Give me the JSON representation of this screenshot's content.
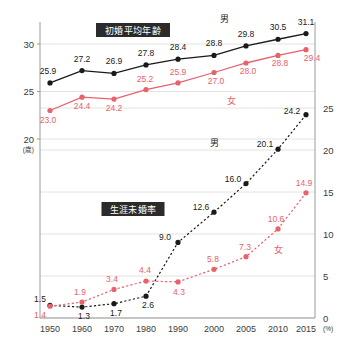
{
  "chart_data": {
    "type": "line",
    "title": "",
    "categories": [
      "1950",
      "1960",
      "1970",
      "1980",
      "1990",
      "2000",
      "2005",
      "2010",
      "2015"
    ],
    "x": [
      1950,
      1960,
      1970,
      1980,
      1990,
      2000,
      2005,
      2010,
      2015
    ],
    "panels": [
      {
        "key": "marriage_age",
        "badge": "初婚平均年齢",
        "axis": "left",
        "ylabel": "(歳)",
        "yticks": [
          20,
          25,
          30
        ],
        "ylim": [
          0,
          32.5
        ],
        "series": [
          {
            "name": "男",
            "color": "#1a1a1a",
            "style": "solid",
            "values": [
              25.9,
              27.2,
              26.9,
              27.8,
              28.4,
              28.8,
              29.8,
              30.5,
              31.1
            ]
          },
          {
            "name": "女",
            "color": "#e8616b",
            "style": "solid",
            "values": [
              23.0,
              24.4,
              24.2,
              25.2,
              25.9,
              27.0,
              28.0,
              28.8,
              29.4
            ]
          }
        ]
      },
      {
        "key": "lifetime_unmarried_rate",
        "badge": "生涯未婚率",
        "axis": "right",
        "ylabel": "(%)",
        "yticks": [
          0,
          5,
          10,
          15,
          20,
          25
        ],
        "ylim": [
          0,
          26
        ],
        "series": [
          {
            "name": "男",
            "color": "#1a1a1a",
            "style": "dashed",
            "values": [
              1.5,
              1.3,
              1.7,
              2.6,
              9.0,
              12.6,
              16.0,
              20.1,
              24.2
            ]
          },
          {
            "name": "女",
            "color": "#e8616b",
            "style": "dashed",
            "values": [
              1.4,
              1.9,
              3.4,
              4.4,
              4.3,
              5.8,
              7.3,
              10.6,
              14.9
            ]
          }
        ]
      }
    ],
    "axis_left": {
      "ticks": [
        "30",
        "25",
        "20"
      ],
      "unit": "(歳)"
    },
    "axis_right": {
      "ticks": [
        "25",
        "20",
        "15",
        "10",
        "5",
        "0"
      ],
      "unit": "(%)"
    },
    "legend": [
      {
        "label": "男",
        "color": "#1a1a1a"
      },
      {
        "label": "女",
        "color": "#e8616b"
      }
    ],
    "grid": true,
    "legend_position": "inline-annotations"
  },
  "labels": {
    "badge_top": "初婚平均年齢",
    "badge_bottom": "生涯未婚率",
    "male": "男",
    "female": "女"
  },
  "colors": {
    "male": "#1a1a1a",
    "female": "#e8616b",
    "grid": "#e2e2e2",
    "frame": "#9a9a9a",
    "badge_bg": "#2b2b2b",
    "background": "#ffffff"
  }
}
